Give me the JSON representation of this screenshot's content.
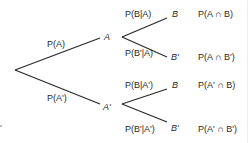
{
  "diagram": {
    "type": "probability-tree",
    "line_color": "#2a2a2a",
    "branch_labels": {
      "p_a": "P(A)",
      "p_a_prime": "P(A')",
      "p_b_given_a": "P(B|A)",
      "p_b_prime_given_a": "P(B'|A)",
      "p_b_given_a_prime": "P(B|A')",
      "p_b_prime_given_a_prime": "P(B'|A')"
    },
    "nodes": {
      "a": "A",
      "a_prime": "A'",
      "b1": "B",
      "b1_prime": "B'",
      "b2": "B",
      "b2_prime": "B'"
    },
    "outcomes": [
      "P(A ∩ B)",
      "P(A ∩ B')",
      "P(A' ∩ B)",
      "P(A' ∩ B')"
    ]
  }
}
